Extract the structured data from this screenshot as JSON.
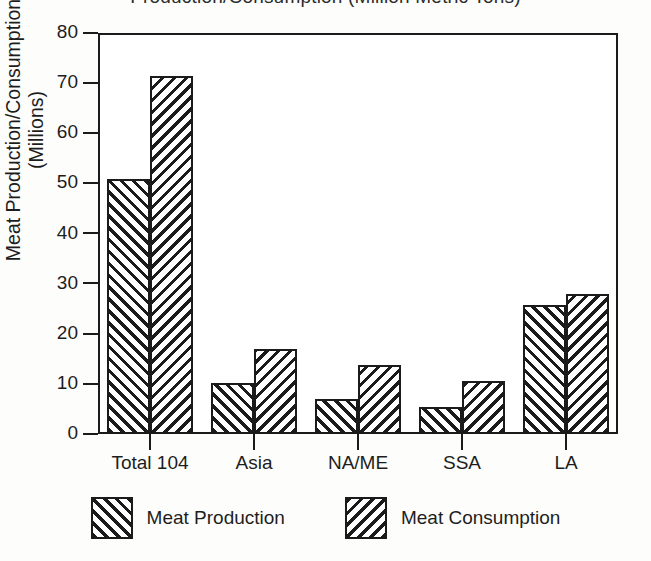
{
  "chart_data": {
    "type": "bar",
    "title": "Production/Consumption (Million Metric Tons)",
    "xlabel": "",
    "ylabel": "Meat Production/Consumption (Millions)",
    "ylabel_lines": [
      "Meat Production/Consumption",
      "(Millions)"
    ],
    "categories": [
      "Total 104",
      "Asia",
      "NA/ME",
      "SSA",
      "LA"
    ],
    "series": [
      {
        "name": "Meat Production",
        "hatch": "forward-diagonal",
        "values": [
          50.8,
          10.2,
          7.0,
          5.4,
          25.8
        ]
      },
      {
        "name": "Meat Consumption",
        "hatch": "backward-diagonal",
        "values": [
          71.5,
          17.0,
          13.7,
          10.5,
          28.0
        ]
      }
    ],
    "ylim": [
      0,
      80
    ],
    "ytick_values": [
      0,
      10,
      20,
      30,
      40,
      50,
      60,
      70,
      80
    ],
    "ytick_labels": [
      "0",
      "10",
      "20",
      "30",
      "40",
      "50",
      "60",
      "70",
      "80"
    ],
    "grid": false,
    "legend_position": "bottom-center",
    "colors": {
      "ink": "#1b1b1b",
      "paper": "#ffffff",
      "text": "#1d1d1d"
    }
  },
  "legend": {
    "entries": [
      {
        "label": "Meat Production"
      },
      {
        "label": "Meat Consumption"
      }
    ]
  }
}
